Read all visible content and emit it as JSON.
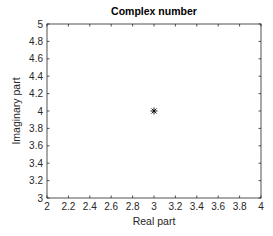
{
  "chart_data": {
    "type": "scatter",
    "title": "Complex number",
    "xlabel": "Real part",
    "ylabel": "Imaginary part",
    "xlim": [
      2,
      4
    ],
    "ylim": [
      3,
      5
    ],
    "xticks": [
      "2",
      "2.2",
      "2.4",
      "2.6",
      "2.8",
      "3",
      "3.2",
      "3.4",
      "3.6",
      "3.8",
      "4"
    ],
    "yticks": [
      "3",
      "3.2",
      "3.4",
      "3.6",
      "3.8",
      "4",
      "4.2",
      "4.4",
      "4.6",
      "4.8",
      "5"
    ],
    "grid": false,
    "legend": null,
    "series": [
      {
        "name": "z",
        "marker": "*",
        "color": "#000000",
        "x": [
          3
        ],
        "y": [
          4
        ]
      }
    ]
  },
  "colors": {
    "axis": "#262626",
    "marker": "#000000",
    "background": "#ffffff"
  }
}
